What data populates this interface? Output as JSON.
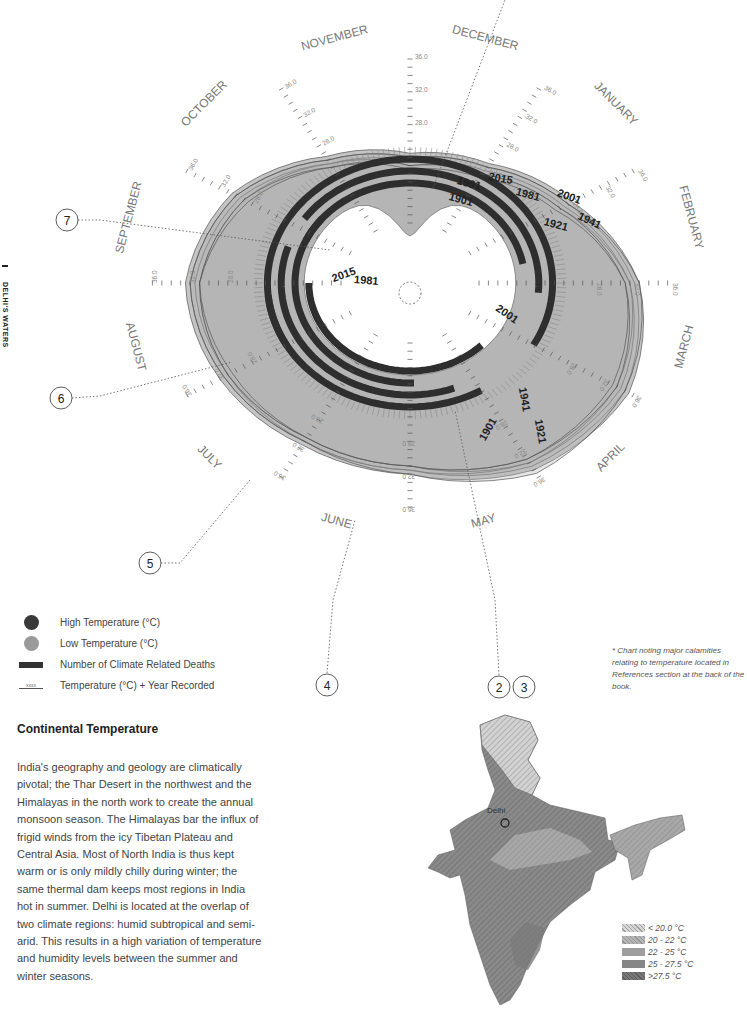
{
  "page": {
    "running_head": "DELHI'S WATERS",
    "section_title": "Continental Temperature",
    "body_text": "India's geography and geology are climatically pivotal; the Thar Desert in the northwest and the Himalayas in the north work to create the annual monsoon season. The Himalayas bar the influx of frigid winds from the icy Tibetan Plateau and Central Asia. Most of North India is thus kept warm or is only mildly chilly during winter; the same thermal dam keeps most regions in India hot in summer. Delhi is located at the overlap of two climate regions: humid subtropical and semi-arid. This results in a high variation of temperature and humidity levels between the summer and winter seasons.",
    "footnote": "* Chart noting major calamities relating to temperature located in References section at the back of the book."
  },
  "legend": [
    {
      "symbol": "dot",
      "color": "#3a3a3a",
      "label": "High Temperature (°C)"
    },
    {
      "symbol": "dot",
      "color": "#9a9a9a",
      "label": "Low Temperature (°C)"
    },
    {
      "symbol": "bar",
      "color": "#333333",
      "label": "Number of Climate Related Deaths"
    },
    {
      "symbol": "line",
      "marker": "xxxx",
      "label": "Temperature (°C) + Year Recorded"
    }
  ],
  "chart_data": {
    "type": "radial",
    "center": [
      410,
      283
    ],
    "months": [
      "DECEMBER",
      "JANUARY",
      "FEBRUARY",
      "MARCH",
      "APRIL",
      "MAY",
      "JUNE",
      "JULY",
      "AUGUST",
      "SEPTEMBER",
      "OCTOBER",
      "NOVEMBER"
    ],
    "month_angles_deg": [
      0,
      30,
      60,
      90,
      120,
      150,
      180,
      210,
      240,
      270,
      300,
      330
    ],
    "axis_tick_labels": [
      "16.0",
      "20.0",
      "24.0",
      "28.0",
      "32.0",
      "36.0"
    ],
    "axis_range": [
      16.0,
      36.0
    ],
    "years": [
      "1901",
      "1921",
      "1941",
      "1961",
      "1981",
      "2001",
      "2015"
    ],
    "series": [
      {
        "name": "2015",
        "high": [
          24.5,
          25.5,
          28.5,
          33.0,
          35.5,
          35.0,
          32.0,
          31.5,
          32.0,
          32.5,
          30.5,
          26.5
        ]
      },
      {
        "name": "2001",
        "high": [
          24.0,
          25.0,
          28.0,
          32.5,
          35.0,
          34.5,
          31.5,
          31.0,
          31.5,
          32.0,
          30.0,
          26.0
        ]
      },
      {
        "name": "1981",
        "high": [
          23.5,
          24.5,
          27.5,
          32.0,
          34.5,
          34.0,
          31.5,
          31.0,
          31.0,
          31.5,
          29.5,
          25.5
        ]
      },
      {
        "name": "1961",
        "high": [
          23.0,
          24.0,
          27.0,
          32.0,
          34.0,
          34.0,
          31.0,
          30.5,
          31.0,
          31.0,
          29.0,
          25.5
        ]
      },
      {
        "name": "1941",
        "high": [
          24.0,
          25.0,
          28.0,
          33.0,
          35.0,
          35.5,
          32.0,
          31.0,
          31.5,
          32.0,
          30.0,
          26.0
        ]
      },
      {
        "name": "1921",
        "high": [
          23.0,
          24.0,
          27.0,
          31.5,
          34.0,
          33.5,
          31.0,
          30.5,
          31.0,
          31.0,
          29.0,
          25.0
        ]
      },
      {
        "name": "1901",
        "high": [
          22.5,
          23.5,
          26.5,
          31.5,
          33.5,
          33.5,
          31.0,
          30.5,
          30.5,
          31.0,
          28.5,
          25.0
        ]
      }
    ],
    "death_arcs": [
      {
        "r": 100,
        "start_deg": 295,
        "end_deg": 80
      },
      {
        "r": 112,
        "start_deg": 305,
        "end_deg": 95
      },
      {
        "r": 124,
        "start_deg": 240,
        "end_deg": 120
      },
      {
        "r": 88,
        "start_deg": 135,
        "end_deg": 270
      },
      {
        "r": 124,
        "start_deg": 150,
        "end_deg": 265
      },
      {
        "r": 112,
        "start_deg": 160,
        "end_deg": 290
      },
      {
        "r": 100,
        "start_deg": 178,
        "end_deg": 310
      }
    ],
    "callouts": [
      {
        "id": "2",
        "x": 499,
        "y": 687
      },
      {
        "id": "3",
        "x": 524,
        "y": 687
      },
      {
        "id": "4",
        "x": 327,
        "y": 685
      },
      {
        "id": "5",
        "x": 150,
        "y": 563
      },
      {
        "id": "6",
        "x": 61,
        "y": 398
      },
      {
        "id": "7",
        "x": 67,
        "y": 220
      }
    ],
    "year_labels": [
      {
        "text": "2015",
        "x": 500,
        "y": 182,
        "rot": 10
      },
      {
        "text": "1961",
        "x": 468,
        "y": 187,
        "rot": 15
      },
      {
        "text": "1981",
        "x": 527,
        "y": 198,
        "rot": 15
      },
      {
        "text": "2001",
        "x": 568,
        "y": 200,
        "rot": 20
      },
      {
        "text": "1901",
        "x": 460,
        "y": 203,
        "rot": 15
      },
      {
        "text": "1921",
        "x": 555,
        "y": 228,
        "rot": 15
      },
      {
        "text": "1941",
        "x": 588,
        "y": 224,
        "rot": 25
      },
      {
        "text": "2015",
        "x": 345,
        "y": 278,
        "rot": -20
      },
      {
        "text": "1981",
        "x": 366,
        "y": 284,
        "rot": 5
      },
      {
        "text": "2001",
        "x": 505,
        "y": 317,
        "rot": 35
      },
      {
        "text": "1941",
        "x": 521,
        "y": 400,
        "rot": 80
      },
      {
        "text": "1921",
        "x": 537,
        "y": 432,
        "rot": 80
      },
      {
        "text": "1901",
        "x": 491,
        "y": 431,
        "rot": -60
      }
    ]
  },
  "map": {
    "city_label": "Delhi",
    "legend": [
      {
        "label": "< 20.0 °C",
        "color": "#c9c9c9"
      },
      {
        "label": "20 - 22 °C",
        "color": "#b0b0b0"
      },
      {
        "label": "22 - 25 °C",
        "color": "#9a9a9a"
      },
      {
        "label": "25 - 27.5 °C",
        "color": "#868686"
      },
      {
        "label": ">27.5 °C",
        "color": "#727272"
      }
    ]
  }
}
